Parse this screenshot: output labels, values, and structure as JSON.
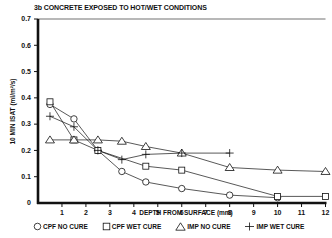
{
  "chart_data": {
    "type": "line",
    "title": "3b  CONCRETE EXPOSED TO HOT/WET CONDITIONS",
    "xlabel": "DEPTH FROM SURFACE (mm)",
    "ylabel": "10 MIN ISAT (ml/m²/s)",
    "xlim": [
      0,
      12
    ],
    "ylim": [
      0,
      0.7
    ],
    "x_ticks": [
      1,
      2,
      3,
      4,
      5,
      6,
      7,
      8,
      9,
      10,
      11,
      12
    ],
    "y_ticks": [
      0,
      0.1,
      0.2,
      0.3,
      0.4,
      0.5,
      0.6,
      0.7
    ],
    "y_tick_labels": [
      "0",
      "0.1",
      "0.2",
      "0.3",
      "0.4",
      "0.5",
      "0.6",
      "0.7"
    ],
    "grid": false,
    "legend_position": "bottom",
    "series": [
      {
        "name": "CPF NO CURE",
        "marker": "circle",
        "x": [
          0.5,
          1.5,
          2.5,
          3.5,
          4.5,
          6,
          8,
          10
        ],
        "values": [
          0.375,
          0.32,
          0.2,
          0.12,
          0.08,
          0.055,
          0.03,
          0.02
        ]
      },
      {
        "name": "CPF WET CURE",
        "marker": "square",
        "x": [
          0.5,
          1.5,
          2.5,
          4.5,
          6,
          10,
          12
        ],
        "values": [
          0.385,
          0.24,
          0.2,
          0.14,
          0.125,
          0.025,
          0.025
        ]
      },
      {
        "name": "IMP NO CURE",
        "marker": "triangle",
        "x": [
          0.5,
          1.5,
          2.5,
          3.5,
          4.5,
          6,
          8,
          10,
          12
        ],
        "values": [
          0.24,
          0.24,
          0.24,
          0.235,
          0.215,
          0.19,
          0.135,
          0.125,
          0.12
        ]
      },
      {
        "name": "IMP WET CURE",
        "marker": "plus",
        "x": [
          0.5,
          1.5,
          2.5,
          3.5,
          4.5,
          6,
          8
        ],
        "values": [
          0.33,
          0.29,
          0.2,
          0.165,
          0.185,
          0.19,
          0.19
        ]
      }
    ]
  },
  "legend": {
    "items": [
      {
        "label": "CPF NO CURE",
        "icon": "circle-marker-icon"
      },
      {
        "label": "CPF WET CURE",
        "icon": "square-marker-icon"
      },
      {
        "label": "IMP NO CURE",
        "icon": "triangle-marker-icon"
      },
      {
        "label": "IMP WET CURE",
        "icon": "plus-marker-icon"
      }
    ]
  },
  "colors": {
    "ink": "#111111",
    "background": "#ffffff"
  }
}
